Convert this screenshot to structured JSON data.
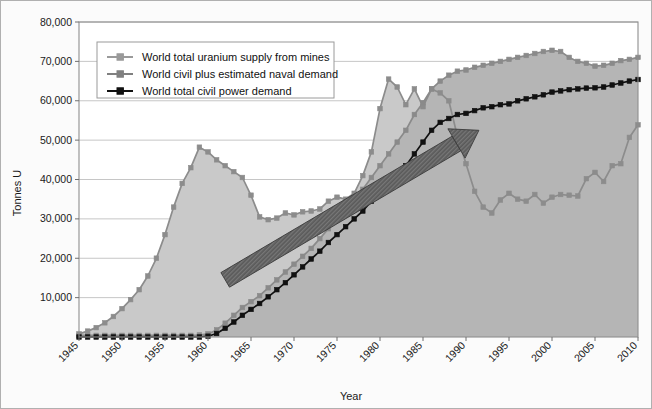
{
  "chart_data": {
    "type": "area",
    "title": "",
    "xlabel": "Year",
    "ylabel": "Tonnes U",
    "xlim": [
      1945,
      2010
    ],
    "ylim": [
      0,
      80000
    ],
    "grid": true,
    "legend_position": "top-left",
    "ytick_labels": [
      "10,000",
      "20,000",
      "30,000",
      "40,000",
      "50,000",
      "60,000",
      "70,000",
      "80,000"
    ],
    "yticks": [
      10000,
      20000,
      30000,
      40000,
      50000,
      60000,
      70000,
      80000
    ],
    "xtick_labels": [
      "1945",
      "1950",
      "1955",
      "1960",
      "1965",
      "1970",
      "1975",
      "1980",
      "1985",
      "1990",
      "1995",
      "2000",
      "2005",
      "2010"
    ],
    "xticks": [
      1945,
      1950,
      1955,
      1960,
      1965,
      1970,
      1975,
      1980,
      1985,
      1990,
      1995,
      2000,
      2005,
      2010
    ],
    "x": [
      1945,
      1946,
      1947,
      1948,
      1949,
      1950,
      1951,
      1952,
      1953,
      1954,
      1955,
      1956,
      1957,
      1958,
      1959,
      1960,
      1961,
      1962,
      1963,
      1964,
      1965,
      1966,
      1967,
      1968,
      1969,
      1970,
      1971,
      1972,
      1973,
      1974,
      1975,
      1976,
      1977,
      1978,
      1979,
      1980,
      1981,
      1982,
      1983,
      1984,
      1985,
      1986,
      1987,
      1988,
      1989,
      1990,
      1991,
      1992,
      1993,
      1994,
      1995,
      1996,
      1997,
      1998,
      1999,
      2000,
      2001,
      2002,
      2003,
      2004,
      2005,
      2006,
      2007,
      2008,
      2009,
      2010
    ],
    "series": [
      {
        "name": "World total uranium supply from mines",
        "color": "#8c8c8c",
        "marker": "square",
        "fill": "#c9c9c9",
        "values": [
          800,
          1500,
          2400,
          3600,
          5200,
          7200,
          9500,
          12000,
          15500,
          20000,
          26000,
          33000,
          39000,
          43000,
          48200,
          47000,
          45000,
          43500,
          42000,
          40500,
          36000,
          30500,
          29800,
          30200,
          31500,
          31000,
          31800,
          32000,
          32500,
          34500,
          35500,
          35000,
          36500,
          41000,
          47000,
          58000,
          65500,
          63500,
          59000,
          63000,
          58500,
          63000,
          62000,
          60000,
          51000,
          44000,
          37000,
          33000,
          31500,
          34800,
          36500,
          35000,
          34500,
          36200,
          34000,
          35500,
          36200,
          36000,
          35800,
          40200,
          41800,
          39500,
          43500,
          44000,
          50700,
          53900
        ]
      },
      {
        "name": "World civil plus estimated naval demand",
        "color": "#8a8a8a",
        "marker": "square",
        "fill": "#b5b5b5",
        "values": [
          400,
          400,
          400,
          400,
          400,
          400,
          400,
          400,
          400,
          400,
          400,
          400,
          400,
          400,
          500,
          800,
          1800,
          3500,
          5500,
          7500,
          9000,
          10500,
          12500,
          14500,
          16500,
          18500,
          20500,
          22500,
          25000,
          27500,
          30000,
          32500,
          35000,
          37500,
          40500,
          43500,
          46500,
          49500,
          52500,
          56500,
          59500,
          63000,
          65000,
          66500,
          67500,
          67800,
          68500,
          69000,
          69500,
          70000,
          70500,
          71000,
          71500,
          72000,
          72500,
          72800,
          72500,
          71000,
          70000,
          69500,
          68800,
          69000,
          69500,
          70200,
          70500,
          71000
        ]
      },
      {
        "name": "World total civil power demand",
        "color": "#111111",
        "marker": "square",
        "fill": "none",
        "values": [
          0,
          0,
          0,
          0,
          0,
          0,
          0,
          0,
          0,
          0,
          0,
          0,
          0,
          0,
          0,
          200,
          900,
          2200,
          3800,
          5500,
          7000,
          8500,
          10200,
          12000,
          13800,
          15800,
          17800,
          19800,
          21800,
          24000,
          26000,
          28000,
          30000,
          32000,
          34500,
          36500,
          38800,
          41000,
          43500,
          46500,
          49500,
          52500,
          54500,
          55500,
          56500,
          56800,
          57500,
          58200,
          58500,
          59000,
          59200,
          60000,
          60500,
          61000,
          61500,
          62200,
          62500,
          62800,
          63000,
          63200,
          63300,
          63500,
          64000,
          64500,
          65000,
          65400
        ]
      }
    ],
    "annotations": [
      {
        "type": "arrow",
        "name": "growth-trend-arrow",
        "color": "#555555",
        "from": [
          1962.0,
          14500
        ],
        "to": [
          1991.5,
          52500
        ]
      }
    ]
  },
  "legend": {
    "entries": [
      {
        "label": "World total uranium supply from mines",
        "color": "#9a9a9a"
      },
      {
        "label": "World civil plus estimated naval demand",
        "color": "#808080"
      },
      {
        "label": "World total civil power demand",
        "color": "#111111"
      }
    ]
  }
}
